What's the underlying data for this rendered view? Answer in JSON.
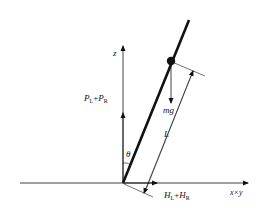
{
  "diagram": {
    "type": "inverted-pendulum-force-diagram",
    "labels": {
      "z_axis": "z",
      "horizontal_axis": "x×y",
      "vertical_force": {
        "main1": "P",
        "sub1": "L",
        "plus": "+",
        "main2": "P",
        "sub2": "R"
      },
      "horizontal_force": {
        "main1": "H",
        "sub1": "L",
        "plus": "+",
        "main2": "H",
        "sub2": "R"
      },
      "gravity": "mg",
      "length": "L",
      "angle": "θ"
    },
    "colors": {
      "line": "#111111",
      "background": "#ffffff"
    }
  }
}
